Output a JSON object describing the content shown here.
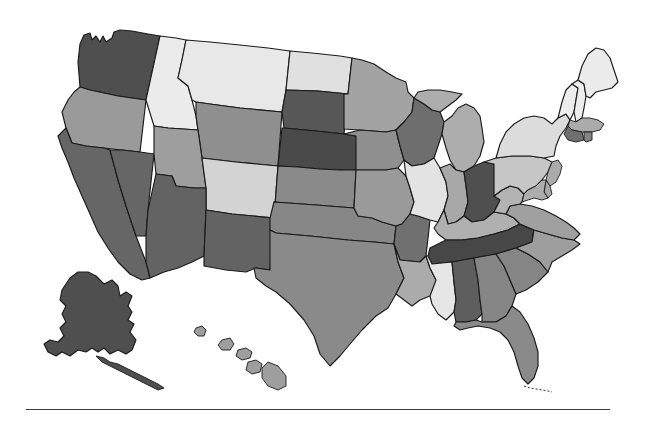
{
  "figure": {
    "type": "choropleth-map",
    "region": "United States",
    "title": "",
    "background_color": "#ffffff",
    "border_color": "#1a1a1a",
    "footer_rule": {
      "present": true,
      "color": "#3a3a3a",
      "x_start": 26,
      "x_end": 610,
      "y": 409
    }
  },
  "legend": {
    "present": false,
    "items": []
  },
  "shades": {
    "very_light": "#ebebeb",
    "light": "#d9d9d9",
    "light_medium": "#c6c6c6",
    "medium": "#b0b0b0",
    "medium_dark": "#9a9a9a",
    "dark": "#7d7d7d",
    "darker": "#666666",
    "very_dark": "#4f4f4f"
  },
  "chart_data": {
    "type": "heatmap",
    "title": "",
    "xlabel": "",
    "ylabel": "",
    "grid": false,
    "legend": "none",
    "categories": [
      "AL",
      "AK",
      "AZ",
      "AR",
      "CA",
      "CO",
      "CT",
      "DE",
      "FL",
      "GA",
      "HI",
      "ID",
      "IL",
      "IN",
      "IA",
      "KS",
      "KY",
      "LA",
      "ME",
      "MD",
      "MA",
      "MI",
      "MN",
      "MS",
      "MO",
      "MT",
      "NE",
      "NV",
      "NH",
      "NJ",
      "NM",
      "NY",
      "NC",
      "ND",
      "OH",
      "OK",
      "OR",
      "PA",
      "RI",
      "SC",
      "SD",
      "TN",
      "TX",
      "UT",
      "VT",
      "VA",
      "WA",
      "WV",
      "WI",
      "WY"
    ],
    "values": [
      7,
      7,
      7,
      6,
      7,
      3,
      6,
      5,
      6,
      6,
      5,
      1,
      2,
      5,
      5,
      5,
      4,
      5,
      1,
      5,
      5,
      5,
      5,
      1,
      5,
      3,
      8,
      7,
      1,
      5,
      7,
      2,
      5,
      2,
      8,
      6,
      5,
      4,
      6,
      6,
      7,
      8,
      5,
      5,
      1,
      5,
      7,
      5,
      6,
      6
    ],
    "value_scale": "1 = lightest shade, 8 = darkest shade"
  },
  "states": [
    {
      "code": "WA",
      "name": "Washington",
      "shade": "very_dark",
      "fill": "#4f4f4f"
    },
    {
      "code": "OR",
      "name": "Oregon",
      "shade": "medium_dark",
      "fill": "#9a9a9a"
    },
    {
      "code": "CA",
      "name": "California",
      "shade": "darker",
      "fill": "#666666"
    },
    {
      "code": "NV",
      "name": "Nevada",
      "shade": "darker",
      "fill": "#666666"
    },
    {
      "code": "ID",
      "name": "Idaho",
      "shade": "very_light",
      "fill": "#ebebeb"
    },
    {
      "code": "MT",
      "name": "Montana",
      "shade": "very_light",
      "fill": "#e8e8e8"
    },
    {
      "code": "WY",
      "name": "Wyoming",
      "shade": "dark",
      "fill": "#8f8f8f"
    },
    {
      "code": "UT",
      "name": "Utah",
      "shade": "medium_dark",
      "fill": "#9e9e9e"
    },
    {
      "code": "CO",
      "name": "Colorado",
      "shade": "light",
      "fill": "#d3d3d3"
    },
    {
      "code": "AZ",
      "name": "Arizona",
      "shade": "darker",
      "fill": "#636363"
    },
    {
      "code": "NM",
      "name": "New Mexico",
      "shade": "darker",
      "fill": "#636363"
    },
    {
      "code": "ND",
      "name": "North Dakota",
      "shade": "light",
      "fill": "#e0e0e0"
    },
    {
      "code": "SD",
      "name": "South Dakota",
      "shade": "very_dark",
      "fill": "#575757"
    },
    {
      "code": "NE",
      "name": "Nebraska",
      "shade": "very_dark",
      "fill": "#4a4a4a"
    },
    {
      "code": "KS",
      "name": "Kansas",
      "shade": "dark",
      "fill": "#8a8a8a"
    },
    {
      "code": "OK",
      "name": "Oklahoma",
      "shade": "dark",
      "fill": "#878787"
    },
    {
      "code": "TX",
      "name": "Texas",
      "shade": "dark",
      "fill": "#8a8a8a"
    },
    {
      "code": "MN",
      "name": "Minnesota",
      "shade": "medium_dark",
      "fill": "#a3a3a3"
    },
    {
      "code": "IA",
      "name": "Iowa",
      "shade": "dark",
      "fill": "#8f8f8f"
    },
    {
      "code": "MO",
      "name": "Missouri",
      "shade": "medium_dark",
      "fill": "#9a9a9a"
    },
    {
      "code": "AR",
      "name": "Arkansas",
      "shade": "darker",
      "fill": "#707070"
    },
    {
      "code": "LA",
      "name": "Louisiana",
      "shade": "medium",
      "fill": "#ababab"
    },
    {
      "code": "WI",
      "name": "Wisconsin",
      "shade": "darker",
      "fill": "#6e6e6e"
    },
    {
      "code": "IL",
      "name": "Illinois",
      "shade": "very_light",
      "fill": "#e3e3e3"
    },
    {
      "code": "MI",
      "name": "Michigan",
      "shade": "medium",
      "fill": "#adadad"
    },
    {
      "code": "IN",
      "name": "Indiana",
      "shade": "medium",
      "fill": "#a8a8a8"
    },
    {
      "code": "OH",
      "name": "Ohio",
      "shade": "very_dark",
      "fill": "#4f4f4f"
    },
    {
      "code": "KY",
      "name": "Kentucky",
      "shade": "medium",
      "fill": "#b0b0b0"
    },
    {
      "code": "TN",
      "name": "Tennessee",
      "shade": "very_dark",
      "fill": "#474747"
    },
    {
      "code": "MS",
      "name": "Mississippi",
      "shade": "very_light",
      "fill": "#e6e6e6"
    },
    {
      "code": "AL",
      "name": "Alabama",
      "shade": "darker",
      "fill": "#5e5e5e"
    },
    {
      "code": "GA",
      "name": "Georgia",
      "shade": "dark",
      "fill": "#858585"
    },
    {
      "code": "FL",
      "name": "Florida",
      "shade": "dark",
      "fill": "#8a8a8a"
    },
    {
      "code": "SC",
      "name": "South Carolina",
      "shade": "dark",
      "fill": "#858585"
    },
    {
      "code": "NC",
      "name": "North Carolina",
      "shade": "medium_dark",
      "fill": "#9e9e9e"
    },
    {
      "code": "VA",
      "name": "Virginia",
      "shade": "medium_dark",
      "fill": "#a0a0a0"
    },
    {
      "code": "WV",
      "name": "West Virginia",
      "shade": "medium",
      "fill": "#b3b3b3"
    },
    {
      "code": "MD",
      "name": "Maryland",
      "shade": "medium",
      "fill": "#adadad"
    },
    {
      "code": "DE",
      "name": "Delaware",
      "shade": "medium",
      "fill": "#a8a8a8"
    },
    {
      "code": "PA",
      "name": "Pennsylvania",
      "shade": "light_medium",
      "fill": "#c6c6c6"
    },
    {
      "code": "NJ",
      "name": "New Jersey",
      "shade": "medium",
      "fill": "#ababab"
    },
    {
      "code": "NY",
      "name": "New York",
      "shade": "light",
      "fill": "#dcdcdc"
    },
    {
      "code": "VT",
      "name": "Vermont",
      "shade": "very_light",
      "fill": "#ededed"
    },
    {
      "code": "NH",
      "name": "New Hampshire",
      "shade": "very_light",
      "fill": "#ededed"
    },
    {
      "code": "ME",
      "name": "Maine",
      "shade": "very_light",
      "fill": "#ebebeb"
    },
    {
      "code": "MA",
      "name": "Massachusetts",
      "shade": "medium",
      "fill": "#ababab"
    },
    {
      "code": "CT",
      "name": "Connecticut",
      "shade": "darker",
      "fill": "#707070"
    },
    {
      "code": "RI",
      "name": "Rhode Island",
      "shade": "dark",
      "fill": "#858585"
    },
    {
      "code": "AK",
      "name": "Alaska",
      "shade": "very_dark",
      "fill": "#4f4f4f"
    },
    {
      "code": "HI",
      "name": "Hawaii",
      "shade": "medium_dark",
      "fill": "#9e9e9e"
    }
  ]
}
